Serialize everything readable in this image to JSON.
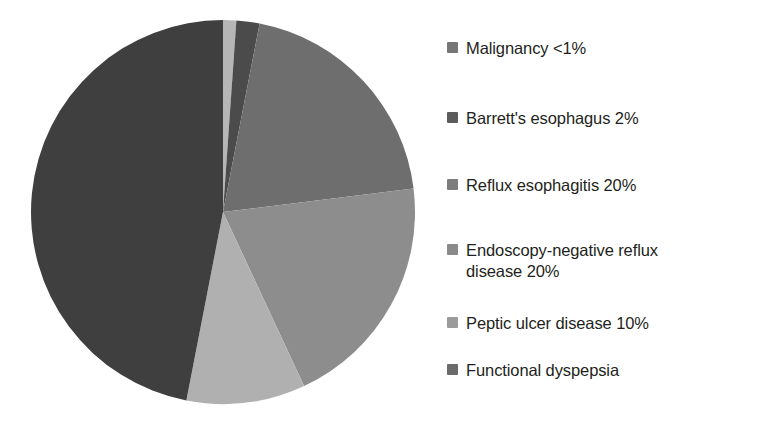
{
  "chart_data": {
    "type": "pie",
    "title": "",
    "subtitle": "",
    "xlabel": "",
    "ylabel": "",
    "legend_position": "right",
    "grid": false,
    "start_angle_deg": 0,
    "direction": "clockwise",
    "categories": [
      "Malignancy",
      "Barrett's esophagus",
      "Reflux esophagitis",
      "Endoscopy-negative reflux disease",
      "Peptic ulcer disease",
      "Functional dyspepsia"
    ],
    "values": [
      1,
      2,
      20,
      20,
      10,
      47
    ],
    "value_labels": [
      "<1%",
      "2%",
      "20%",
      "20%",
      "10%",
      ""
    ],
    "colors": [
      "#b6b6b6",
      "#4b4b4b",
      "#6e6e6e",
      "#8d8d8d",
      "#b0b0b0",
      "#3f3f3f"
    ],
    "slices": [
      {
        "name": "Malignancy",
        "value": 1,
        "value_label": "<1%",
        "color": "#b6b6b6",
        "start_deg": 0,
        "end_deg": 4
      },
      {
        "name": "Barrett's esophagus",
        "value": 2,
        "value_label": "2%",
        "color": "#4b4b4b",
        "start_deg": 4,
        "end_deg": 11
      },
      {
        "name": "Reflux esophagitis",
        "value": 20,
        "value_label": "20%",
        "color": "#6e6e6e",
        "start_deg": 11,
        "end_deg": 83
      },
      {
        "name": "Endoscopy-negative reflux disease",
        "value": 20,
        "value_label": "20%",
        "color": "#8d8d8d",
        "start_deg": 83,
        "end_deg": 155
      },
      {
        "name": "Peptic ulcer disease",
        "value": 10,
        "value_label": "10%",
        "color": "#b0b0b0",
        "start_deg": 155,
        "end_deg": 191
      },
      {
        "name": "Functional dyspepsia",
        "value": 47,
        "value_label": "",
        "color": "#3f3f3f",
        "start_deg": 191,
        "end_deg": 360
      }
    ]
  },
  "legend": {
    "items": [
      {
        "label": "Malignancy <1%",
        "color": "#767676",
        "top": 38
      },
      {
        "label": "Barrett's esophagus 2%",
        "color": "#5c5c5c",
        "top": 108
      },
      {
        "label": "Reflux esophagitis 20%",
        "color": "#7d7d7d",
        "top": 175
      },
      {
        "label": "Endoscopy-negative reflux\ndisease 20%",
        "color": "#8a8a8a",
        "top": 240
      },
      {
        "label": "Peptic ulcer disease 10%",
        "color": "#9b9b9b",
        "top": 313
      },
      {
        "label": "Functional dyspepsia",
        "color": "#6b6b6b",
        "top": 360
      }
    ]
  },
  "geometry": {
    "center_x": 223,
    "center_y": 212,
    "radius": 192
  }
}
